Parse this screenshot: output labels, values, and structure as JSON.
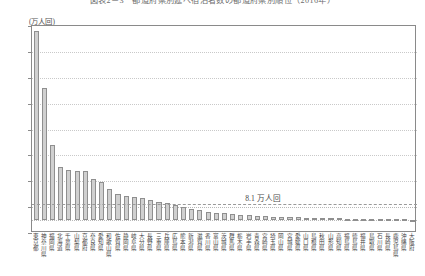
{
  "chart_title": "図表2－3　都道府県別延べ宿泊者数の都道府県別順位（2016年）",
  "unit_label": "(万人回)",
  "average_annotation": "8.1 万人回",
  "colors": {
    "bar_fill": "#d0d0d0",
    "bar_stroke": "#8f8f8f",
    "frame": "#8a8a8a",
    "grid": "#c9c9c9",
    "average_line": "#9a9a9a"
  },
  "chart_data": {
    "type": "bar",
    "title": "図表2－3　都道府県別延べ宿泊者数の都道府県別順位（2016年）",
    "xlabel": "",
    "ylabel": "(万人回)",
    "ylim": [
      -50,
      750
    ],
    "yticks": [
      750,
      650,
      550,
      450,
      350,
      250,
      150,
      50,
      -50
    ],
    "ytick_labels": [
      "750",
      "650",
      "550",
      "450",
      "350",
      "250",
      "150",
      "50",
      "-50"
    ],
    "grid": true,
    "legend": false,
    "annotations": [
      {
        "text": "8.1 万人回",
        "value": 8.1,
        "type": "average-line"
      }
    ],
    "categories": [
      "東京都",
      "神奈川県",
      "福岡県",
      "北海道",
      "千葉県",
      "山梨県",
      "京都府",
      "奈良県",
      "愛知県",
      "和歌山県",
      "佐賀県",
      "静岡県",
      "岐阜県",
      "大分県",
      "長野県",
      "三重県",
      "兵庫県",
      "広島県",
      "熊本県",
      "新潟県",
      "滋賀県",
      "香川県",
      "富山県",
      "茨城県",
      "群馬県",
      "栃木県",
      "岩手県",
      "青森県",
      "宮崎県",
      "埼玉県",
      "岡山県",
      "宮城県",
      "愛媛県",
      "山口県",
      "島根県",
      "秋田県",
      "山形県",
      "高知県",
      "福島県",
      "徳島県",
      "福井県",
      "鳥取県",
      "石川県",
      "長崎県",
      "鹿児島県",
      "沖縄県",
      "大阪府"
    ],
    "values": [
      730,
      510,
      290,
      205,
      193,
      190,
      188,
      160,
      148,
      120,
      100,
      92,
      88,
      84,
      78,
      70,
      66,
      58,
      50,
      44,
      38,
      33,
      29,
      26,
      23,
      20,
      18,
      16,
      14,
      13,
      12,
      11,
      10,
      9,
      8.5,
      8,
      7,
      6.5,
      6,
      5.5,
      5,
      4.5,
      4,
      3.5,
      3,
      2.5,
      2
    ]
  }
}
